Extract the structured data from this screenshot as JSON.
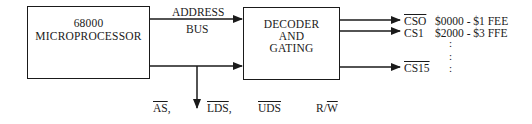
{
  "diagram": {
    "cpu_box": {
      "line1": "68000",
      "line2": "MICROPROCESSOR"
    },
    "bus_label": {
      "line1": "ADDRESS",
      "line2": "BUS"
    },
    "decoder_box": {
      "line1": "DECODER",
      "line2": "AND",
      "line3": "GATING"
    },
    "outputs": [
      {
        "signal": "CSO",
        "active_low": true,
        "range": "$0000 - $1 FEE"
      },
      {
        "signal": "CS1",
        "active_low": false,
        "range": "$2000 - $3 FFE"
      },
      {
        "signal": "CS15",
        "active_low": true,
        "range": ":"
      }
    ],
    "ellipsis": ":",
    "control_signals": [
      {
        "name": "AS",
        "suffix": ",",
        "active_low": true
      },
      {
        "name": "LDS",
        "suffix": ",",
        "active_low": true
      },
      {
        "name": "UDS",
        "suffix": "",
        "active_low": true
      },
      {
        "name_prefix": "R/",
        "name": "W",
        "suffix": "",
        "active_low": true
      }
    ]
  }
}
